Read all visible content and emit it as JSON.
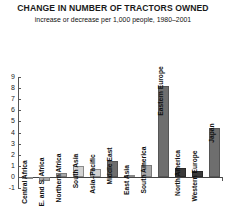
{
  "chart_data": {
    "type": "bar",
    "title": "CHANGE IN NUMBER OF TRACTORS OWNED",
    "subtitle": "increase or decrease per 1,000 people, 1980–2001",
    "xlabel": "",
    "ylabel": "",
    "ylim": [
      -1,
      9
    ],
    "yticks": [
      "-1",
      "0",
      "1",
      "2",
      "3",
      "4",
      "5",
      "6",
      "7",
      "8",
      "9"
    ],
    "grid": false,
    "legend": "none",
    "categories": [
      "Central Africa",
      "E. and S. Africa",
      "Northern Africa",
      "South Asia",
      "Asia–Pacific",
      "Middle East",
      "East Asia",
      "South America",
      "Eastern Europe",
      "North America",
      "Western Europe",
      "Japan"
    ],
    "values": [
      0.0,
      -0.4,
      0.35,
      1.0,
      0.75,
      1.4,
      0.15,
      1.1,
      8.2,
      0.8,
      0.5,
      4.4
    ],
    "bar_shades": [
      "light",
      "mid",
      "mid",
      "light",
      "light",
      "dark",
      "light",
      "mid",
      "dark",
      "vdark",
      "vdark",
      "dark"
    ]
  },
  "colors": {
    "background": "#ffffff",
    "axis": "#555555",
    "text": "#111111",
    "bar_light": "#d2d2d2",
    "bar_mid": "#a8a8a8",
    "bar_dark": "#6e6e6e",
    "bar_vdark": "#3a3a3a"
  }
}
